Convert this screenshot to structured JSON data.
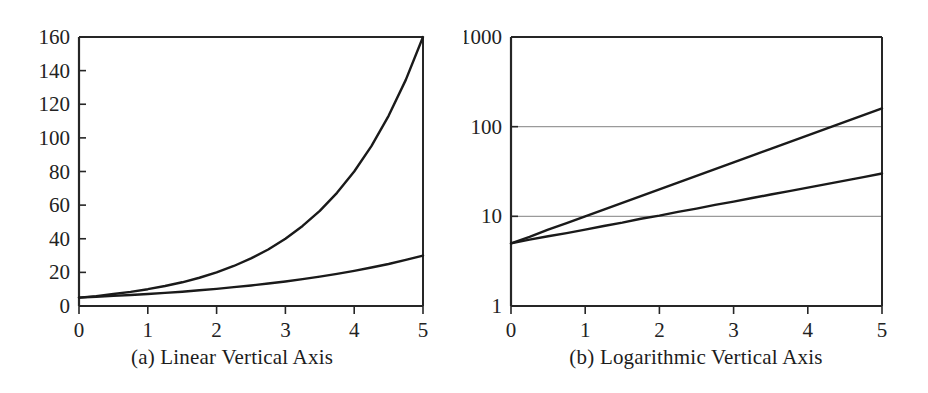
{
  "figure": {
    "background_color": "#ffffff",
    "axis_color": "#262626",
    "grid_color": "#9a9a9a",
    "curve_color": "#1a1a1a"
  },
  "panels": [
    {
      "id": "a",
      "caption": "(a) Linear Vertical Axis",
      "caption_index": "(a)",
      "caption_text": "Linear Vertical Axis"
    },
    {
      "id": "b",
      "caption": "(b) Logarithmic Vertical Axis",
      "caption_index": "(b)",
      "caption_text": "Logarithmic Vertical Axis"
    }
  ],
  "chart_data": [
    {
      "type": "line",
      "panel": "a",
      "title": "(a) Linear Vertical Axis",
      "xlabel": "",
      "ylabel": "",
      "yscale": "linear",
      "xscale": "linear",
      "xlim": [
        0,
        5
      ],
      "ylim": [
        0,
        160
      ],
      "xticks": [
        0,
        1,
        2,
        3,
        4,
        5
      ],
      "xtick_labels": [
        "0",
        "1",
        "2",
        "3",
        "4",
        "5"
      ],
      "yticks": [
        0,
        20,
        40,
        60,
        80,
        100,
        120,
        140,
        160
      ],
      "ytick_labels": [
        "0",
        "20",
        "40",
        "60",
        "80",
        "100",
        "120",
        "140",
        "160"
      ],
      "grid": false,
      "legend": null,
      "x": [
        0,
        0.25,
        0.5,
        0.75,
        1,
        1.25,
        1.5,
        1.75,
        2,
        2.25,
        2.5,
        2.75,
        3,
        3.25,
        3.5,
        3.75,
        4,
        4.25,
        4.5,
        4.75,
        5
      ],
      "series": [
        {
          "name": "fast exponential",
          "formula": "y = 5 e^(0.6931 x)",
          "values": [
            5.0,
            5.9,
            7.1,
            8.4,
            10.0,
            11.9,
            14.1,
            16.8,
            20.0,
            23.8,
            28.3,
            33.6,
            40.0,
            47.6,
            56.6,
            67.3,
            80.0,
            95.1,
            113.1,
            134.5,
            160.0
          ]
        },
        {
          "name": "slow exponential",
          "formula": "y = 5 e^(0.3583 x)",
          "values": [
            5.0,
            5.5,
            6.0,
            6.5,
            7.1,
            7.8,
            8.5,
            9.4,
            10.2,
            11.2,
            12.2,
            13.4,
            14.6,
            16.0,
            17.5,
            19.1,
            20.9,
            22.9,
            25.0,
            27.4,
            30.0
          ]
        }
      ]
    },
    {
      "type": "line",
      "panel": "b",
      "title": "(b) Logarithmic Vertical Axis",
      "xlabel": "",
      "ylabel": "",
      "yscale": "log",
      "xscale": "linear",
      "xlim": [
        0,
        5
      ],
      "ylim": [
        1,
        1000
      ],
      "xticks": [
        0,
        1,
        2,
        3,
        4,
        5
      ],
      "xtick_labels": [
        "0",
        "1",
        "2",
        "3",
        "4",
        "5"
      ],
      "yticks": [
        1,
        10,
        100,
        1000
      ],
      "ytick_labels": [
        "1",
        "10",
        "100",
        "1000"
      ],
      "grid": true,
      "gridlines_y": [
        10,
        100
      ],
      "legend": null,
      "x": [
        0,
        0.25,
        0.5,
        0.75,
        1,
        1.25,
        1.5,
        1.75,
        2,
        2.25,
        2.5,
        2.75,
        3,
        3.25,
        3.5,
        3.75,
        4,
        4.25,
        4.5,
        4.75,
        5
      ],
      "series": [
        {
          "name": "fast exponential",
          "formula": "y = 5 e^(0.6931 x)",
          "values": [
            5.0,
            5.9,
            7.1,
            8.4,
            10.0,
            11.9,
            14.1,
            16.8,
            20.0,
            23.8,
            28.3,
            33.6,
            40.0,
            47.6,
            56.6,
            67.3,
            80.0,
            95.1,
            113.1,
            134.5,
            160.0
          ]
        },
        {
          "name": "slow exponential",
          "formula": "y = 5 e^(0.3583 x)",
          "values": [
            5.0,
            5.5,
            6.0,
            6.5,
            7.1,
            7.8,
            8.5,
            9.4,
            10.2,
            11.2,
            12.2,
            13.4,
            14.6,
            16.0,
            17.5,
            19.1,
            20.9,
            22.9,
            25.0,
            27.4,
            30.0
          ]
        }
      ]
    }
  ]
}
